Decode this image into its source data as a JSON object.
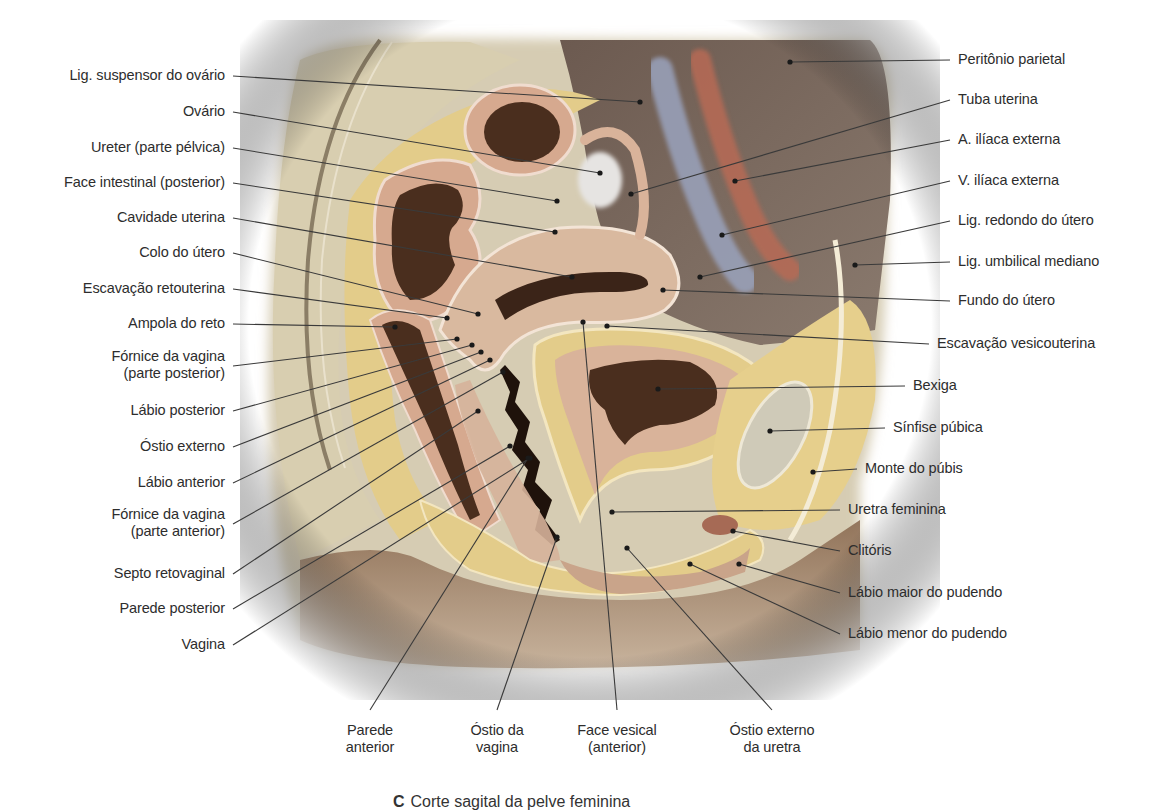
{
  "figure": {
    "caption_letter": "C",
    "caption_text": "Corte sagital da pelve feminina"
  },
  "colors": {
    "background": "#ffffff",
    "label_text": "#2d2d2d",
    "leader_line": "#3a3a3a",
    "fat_yellow": "#e8d28f",
    "bone_beige": "#d8ceb0",
    "muscle_pink": "#d9b39a",
    "cavity_dark": "#4a2e1e",
    "peritoneum_brown": "#7d6a5e",
    "artery_red": "#b86a55",
    "vein_blue": "#9aa3bd",
    "skin_tan": "#a98a6e",
    "ovary_white": "#e6e4e2"
  },
  "labels_left": [
    {
      "id": "lig-suspensor-ovario",
      "text": "Lig. suspensor do ovário",
      "y": 76,
      "tx": 640,
      "ty": 102
    },
    {
      "id": "ovario",
      "text": "Ovário",
      "y": 112,
      "tx": 600,
      "ty": 173
    },
    {
      "id": "ureter",
      "text": "Ureter (parte pélvica)",
      "y": 148,
      "tx": 557,
      "ty": 201
    },
    {
      "id": "face-intestinal",
      "text": "Face intestinal (posterior)",
      "y": 183,
      "tx": 555,
      "ty": 232
    },
    {
      "id": "cavidade-uterina",
      "text": "Cavidade uterina",
      "y": 218,
      "tx": 572,
      "ty": 277
    },
    {
      "id": "colo-utero",
      "text": "Colo do útero",
      "y": 253,
      "tx": 478,
      "ty": 314
    },
    {
      "id": "escavacao-retouterina",
      "text": "Escavação retouterina",
      "y": 289,
      "tx": 447,
      "ty": 318
    },
    {
      "id": "ampola-reto",
      "text": "Ampola do reto",
      "y": 324,
      "tx": 395,
      "ty": 327
    },
    {
      "id": "fornice-posterior",
      "text": "Fórnice da vagina\n(parte posterior)",
      "y": 357,
      "tx": 457,
      "ty": 339
    },
    {
      "id": "labio-posterior",
      "text": "Lábio posterior",
      "y": 411,
      "tx": 472,
      "ty": 345
    },
    {
      "id": "ostio-externo",
      "text": "Óstio externo",
      "y": 447,
      "tx": 481,
      "ty": 352
    },
    {
      "id": "labio-anterior",
      "text": "Lábio anterior",
      "y": 483,
      "tx": 490,
      "ty": 360
    },
    {
      "id": "fornice-anterior",
      "text": "Fórnice da vagina\n(parte anterior)",
      "y": 515,
      "tx": 503,
      "ty": 372
    },
    {
      "id": "septo-retovaginal",
      "text": "Septo retovaginal",
      "y": 574,
      "tx": 478,
      "ty": 411
    },
    {
      "id": "parede-posterior",
      "text": "Parede posterior",
      "y": 609,
      "tx": 510,
      "ty": 446
    },
    {
      "id": "vagina",
      "text": "Vagina",
      "y": 645,
      "tx": 530,
      "ty": 458
    }
  ],
  "labels_right": [
    {
      "id": "peritonio-parietal",
      "text": "Peritônio parietal",
      "y": 60,
      "tx": 790,
      "ty": 62
    },
    {
      "id": "tuba-uterina",
      "text": "Tuba uterina",
      "y": 100,
      "tx": 631,
      "ty": 194
    },
    {
      "id": "a-iliaca-externa",
      "text": "A. ilíaca externa",
      "y": 140,
      "tx": 735,
      "ty": 181
    },
    {
      "id": "v-iliaca-externa",
      "text": "V. ilíaca externa",
      "y": 181,
      "tx": 722,
      "ty": 235
    },
    {
      "id": "lig-redondo",
      "text": "Lig. redondo do útero",
      "y": 221,
      "tx": 700,
      "ty": 277
    },
    {
      "id": "lig-umbilical",
      "text": "Lig. umbilical mediano",
      "y": 262,
      "tx": 855,
      "ty": 265
    },
    {
      "id": "fundo-utero",
      "text": "Fundo do útero",
      "y": 301,
      "tx": 663,
      "ty": 290
    },
    {
      "id": "escavacao-vesicouterina",
      "text": "Escavação vesicouterina",
      "y": 344,
      "tx": 607,
      "ty": 326
    },
    {
      "id": "bexiga",
      "text": "Bexiga",
      "y": 386,
      "tx": 658,
      "ty": 389
    },
    {
      "id": "sinfise-pubica",
      "text": "Sínfise púbica",
      "y": 428,
      "tx": 770,
      "ty": 431
    },
    {
      "id": "monte-pubis",
      "text": "Monte do púbis",
      "y": 469,
      "tx": 813,
      "ty": 472
    },
    {
      "id": "uretra-feminina",
      "text": "Uretra feminina",
      "y": 510,
      "tx": 612,
      "ty": 512
    },
    {
      "id": "clitoris",
      "text": "Clitóris",
      "y": 551,
      "tx": 733,
      "ty": 531
    },
    {
      "id": "labio-maior",
      "text": "Lábio maior do pudendo",
      "y": 593,
      "tx": 739,
      "ty": 564
    },
    {
      "id": "labio-menor",
      "text": "Lábio menor do pudendo",
      "y": 634,
      "tx": 690,
      "ty": 564
    }
  ],
  "labels_bottom": [
    {
      "id": "parede-anterior",
      "text": "Parede\nanterior",
      "x": 370,
      "y": 722,
      "tx": 528,
      "ty": 458
    },
    {
      "id": "ostio-vagina",
      "text": "Óstio da\nvagina",
      "x": 497,
      "y": 722,
      "tx": 557,
      "ty": 537
    },
    {
      "id": "face-vesical",
      "text": "Face vesical\n(anterior)",
      "x": 617,
      "y": 722,
      "tx": 583,
      "ty": 322
    },
    {
      "id": "ostio-externo-uretra",
      "text": "Óstio externo\nda uretra",
      "x": 772,
      "y": 722,
      "tx": 627,
      "ty": 548
    }
  ]
}
